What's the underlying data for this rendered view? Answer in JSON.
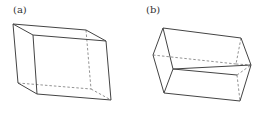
{
  "figures": [
    {
      "label": "(a)",
      "label_pos": [
        13,
        6
      ],
      "description": "oblique parallelepiped (sheared box)",
      "solid_edges": [
        [
          13,
          24,
          86,
          30
        ],
        [
          13,
          24,
          33,
          35
        ],
        [
          86,
          30,
          106,
          41
        ],
        [
          33,
          35,
          106,
          41
        ],
        [
          13,
          24,
          18,
          83
        ],
        [
          33,
          35,
          37,
          94
        ],
        [
          106,
          41,
          111,
          100
        ],
        [
          18,
          83,
          37,
          94
        ],
        [
          37,
          94,
          111,
          100
        ]
      ],
      "dashed_edges": [
        [
          86,
          30,
          91,
          89
        ],
        [
          18,
          83,
          91,
          89
        ],
        [
          91,
          89,
          111,
          100
        ]
      ]
    },
    {
      "label": "(b)",
      "label_pos": [
        146,
        6
      ],
      "description": "hexagonal-prism-like box tilted",
      "solid_edges": [
        [
          163,
          28,
          241,
          38
        ],
        [
          163,
          28,
          153,
          55
        ],
        [
          163,
          28,
          173,
          69
        ],
        [
          153,
          55,
          164,
          93
        ],
        [
          173,
          69,
          164,
          93
        ],
        [
          173,
          69,
          251,
          65
        ],
        [
          241,
          38,
          251,
          65
        ],
        [
          164,
          93,
          240,
          101
        ],
        [
          251,
          65,
          240,
          101
        ],
        [
          173,
          69,
          237,
          75
        ]
      ],
      "dashed_edges": [
        [
          153,
          55,
          236,
          64
        ],
        [
          241,
          38,
          236,
          64
        ],
        [
          236,
          64,
          251,
          65
        ],
        [
          237,
          75,
          251,
          65
        ],
        [
          237,
          75,
          240,
          101
        ]
      ]
    }
  ],
  "colors": {
    "stroke": "#444444",
    "dashed": "#777777",
    "label": "#333333"
  }
}
